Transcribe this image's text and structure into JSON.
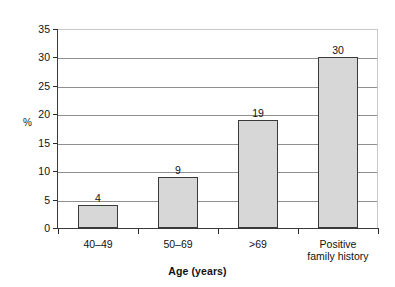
{
  "chart_data": {
    "type": "bar",
    "title": "",
    "xlabel": "Age (years)",
    "ylabel": "%",
    "categories": [
      "40–49",
      "50–69",
      ">69",
      "Positive\nfamily history"
    ],
    "values": [
      4,
      9,
      19,
      30
    ],
    "value_labels": [
      "4",
      "9",
      "19",
      "30"
    ],
    "ylim": [
      0,
      35
    ],
    "ytick_labels": [
      "0",
      "5",
      "10",
      "15",
      "20",
      "25",
      "30",
      "35"
    ],
    "ytick_values": [
      0,
      5,
      10,
      15,
      20,
      25,
      30,
      35
    ],
    "grid": true,
    "grid_axis": "y",
    "legend": "none",
    "colors": {
      "bar_fill": "#d7d7d7",
      "bar_border": "#3a3a3a",
      "gridline": "#8f8f8f",
      "axis": "#3a3a3a",
      "text": "#111111",
      "background": "#ffffff"
    }
  }
}
